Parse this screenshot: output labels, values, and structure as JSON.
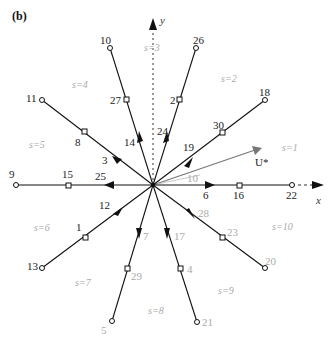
{
  "panel_label": "(b)",
  "axes": {
    "x_label": "x",
    "y_label": "y"
  },
  "vector_label": "U*",
  "sector_labels": [
    "s=1",
    "s=2",
    "s=3",
    "s=4",
    "s=5",
    "s=6",
    "s=7",
    "s=8",
    "s=9",
    "s=10"
  ],
  "rays": [
    {
      "dir": "up-left-steep",
      "end_node": "10",
      "mid_node": "27",
      "arrow": "14"
    },
    {
      "dir": "up-right-steep",
      "end_node": "26",
      "mid_node": "2",
      "arrow": "24"
    },
    {
      "dir": "up-right",
      "end_node": "18",
      "mid_node": "30",
      "arrow": "19"
    },
    {
      "dir": "up-left",
      "end_node": "11",
      "mid_node": "8",
      "arrow": "3"
    },
    {
      "dir": "left",
      "end_node": "9",
      "mid_node": "15",
      "arrow": "25"
    },
    {
      "dir": "right",
      "end_node": "22",
      "mid_node": "16",
      "arrow": "6"
    },
    {
      "dir": "down-left",
      "end_node": "13",
      "mid_node": "1",
      "arrow": "12"
    },
    {
      "dir": "down-left-steep",
      "end_node": "5",
      "mid_node": "29",
      "arrow": "7"
    },
    {
      "dir": "down-right-steep",
      "end_node": "21",
      "mid_node": "4",
      "arrow": "17"
    },
    {
      "dir": "down-right",
      "end_node": "20",
      "mid_node": "23",
      "arrow": "28"
    }
  ],
  "gray_label": "10",
  "labels": {
    "n10": "10",
    "n26": "26",
    "n18": "18",
    "n11": "11",
    "n9": "9",
    "n22": "22",
    "n13": "13",
    "n5": "5",
    "n21": "21",
    "n20": "20",
    "n27": "27",
    "n2": "2",
    "n30": "30",
    "n8": "8",
    "n15": "15",
    "n16": "16",
    "n1": "1",
    "n29": "29",
    "n4": "4",
    "n23": "23",
    "a14": "14",
    "a24": "24",
    "a19": "19",
    "a3": "3",
    "a25": "25",
    "a6": "6",
    "a12": "12",
    "a7": "7",
    "a17": "17",
    "a28": "28"
  }
}
